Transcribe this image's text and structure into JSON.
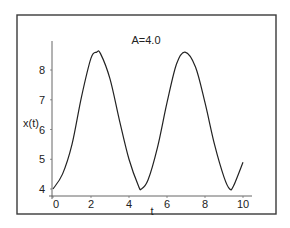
{
  "chart_data": {
    "type": "line",
    "title": "A=4.0",
    "xlabel": "t",
    "ylabel": "x(t)",
    "xlim": [
      0,
      10
    ],
    "ylim": [
      3.8,
      8.9
    ],
    "x_ticks": [
      0,
      2,
      4,
      6,
      8,
      10
    ],
    "x_tick_labels": [
      "0",
      "2",
      "4",
      "6",
      "8",
      "10"
    ],
    "y_ticks": [
      4,
      5,
      6,
      7,
      8
    ],
    "y_tick_labels": [
      "4",
      "5",
      "6",
      "7",
      "8"
    ],
    "grid": false,
    "legend": null,
    "series": [
      {
        "name": "x(t)",
        "x": [
          0,
          0.5,
          1.0,
          1.5,
          2.0,
          2.3,
          2.5,
          3.0,
          3.5,
          4.0,
          4.5,
          4.65,
          5.0,
          5.5,
          6.0,
          6.5,
          6.95,
          7.5,
          8.0,
          8.5,
          9.0,
          9.3,
          9.5,
          10.0
        ],
        "values": [
          4.0,
          4.5,
          5.5,
          7.1,
          8.4,
          8.6,
          8.55,
          7.7,
          6.3,
          5.0,
          4.1,
          4.0,
          4.3,
          5.4,
          6.9,
          8.2,
          8.6,
          8.1,
          6.9,
          5.5,
          4.4,
          4.0,
          4.1,
          4.9
        ]
      }
    ],
    "annotations": [
      {
        "text": "A=4.0",
        "position": "top-center"
      }
    ]
  },
  "labels": {
    "title": "A=4.0",
    "xlabel": "t",
    "ylabel": "x(t)",
    "x_ticks": [
      "0",
      "2",
      "4",
      "6",
      "8",
      "10"
    ],
    "y_ticks": [
      "4",
      "5",
      "6",
      "7",
      "8"
    ]
  },
  "colors": {
    "line": "#222222",
    "frame": "#3a3a3a",
    "background": "#ffffff"
  }
}
